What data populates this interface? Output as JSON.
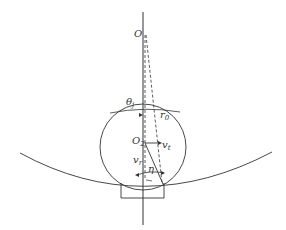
{
  "diagram": {
    "labels": {
      "O": "O",
      "theta": "θ",
      "theta_sub": "j",
      "r": "r",
      "r_sub": "0",
      "O2": "O",
      "O2_sub": "2",
      "vt": "v",
      "vt_sub": "t",
      "vr": "v",
      "vr_sub": "r",
      "eta": "η"
    },
    "colors": {
      "stroke": "#333333",
      "background": "#ffffff"
    }
  }
}
